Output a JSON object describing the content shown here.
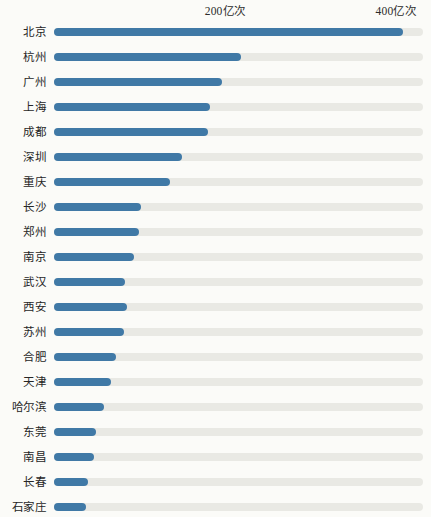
{
  "chart": {
    "type": "bar",
    "orientation": "horizontal",
    "axis_labels": [
      "200亿次",
      "400亿次"
    ],
    "colors": {
      "bar": "#4079a6",
      "track": "#e9e9e4",
      "background": "#fbfbf8",
      "text": "#262626"
    }
  },
  "chart_data": {
    "type": "bar",
    "title": "",
    "subtitle": "",
    "xlabel": "",
    "ylabel": "",
    "orientation": "horizontal",
    "grid": false,
    "legend": null,
    "unit": "亿次",
    "xlim": [
      0,
      432
    ],
    "xticks": [
      200,
      400
    ],
    "xticklabels": [
      "200亿次",
      "400亿次"
    ],
    "categories": [
      "北京",
      "杭州",
      "广州",
      "上海",
      "成都",
      "深圳",
      "重庆",
      "长沙",
      "郑州",
      "南京",
      "武汉",
      "西安",
      "苏州",
      "合肥",
      "天津",
      "哈尔滨",
      "东莞",
      "南昌",
      "长春",
      "石家庄"
    ],
    "values": [
      409,
      219,
      197,
      183,
      180,
      150,
      136,
      102,
      100,
      94,
      83,
      85,
      82,
      72,
      67,
      58,
      49,
      47,
      40,
      37
    ]
  }
}
